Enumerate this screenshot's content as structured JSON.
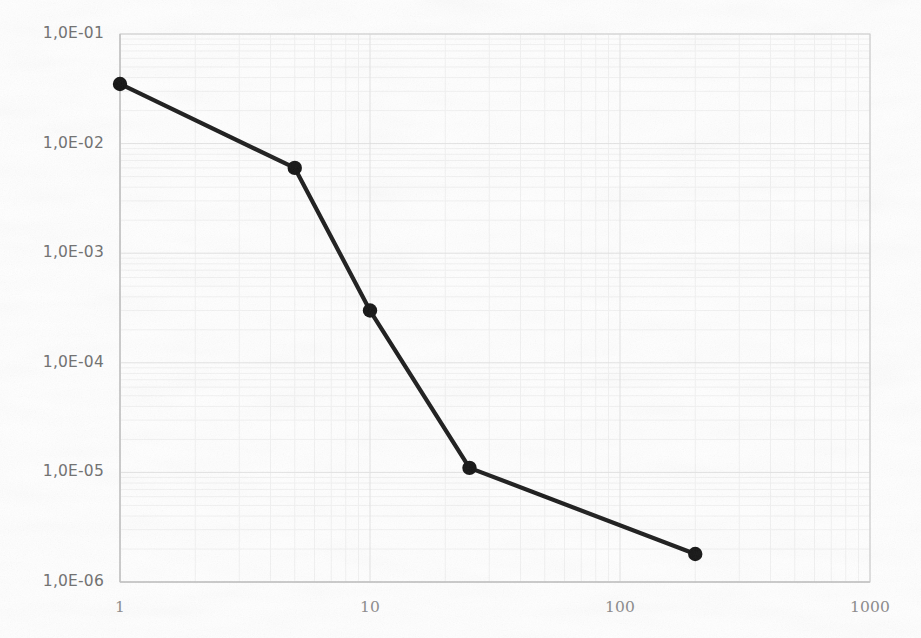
{
  "chart_data": {
    "type": "line",
    "title": "",
    "subtitle": "",
    "xlabel": "",
    "ylabel": "",
    "xscale": "log",
    "yscale": "log",
    "xlim": [
      1,
      1000
    ],
    "ylim": [
      1e-06,
      0.1
    ],
    "grid": true,
    "legend": null,
    "legend_position": "none",
    "marker": "filled-circle",
    "line_color": "#1a1a1a",
    "marker_color": "#111111",
    "x": [
      1,
      5,
      10,
      25,
      200
    ],
    "values": [
      0.035,
      0.006,
      0.0003,
      1.1e-05,
      1.8e-06
    ],
    "points": [
      {
        "x": 1,
        "y": 0.035
      },
      {
        "x": 5,
        "y": 0.006
      },
      {
        "x": 10,
        "y": 0.0003
      },
      {
        "x": 25,
        "y": 1.1e-05
      },
      {
        "x": 200,
        "y": 1.8e-06
      }
    ],
    "series": [
      {
        "name": "",
        "x": [
          1,
          5,
          10,
          25,
          200
        ],
        "values": [
          0.035,
          0.006,
          0.0003,
          1.1e-05,
          1.8e-06
        ]
      }
    ],
    "xticks": [
      1,
      10,
      100,
      1000
    ],
    "xtick_labels": [
      "1",
      "10",
      "100",
      "1000"
    ],
    "yticks": [
      0.1,
      0.01,
      0.001,
      0.0001,
      1e-05,
      1e-06
    ],
    "ytick_labels": [
      "1,0E-01",
      "1,0E-02",
      "1,0E-03",
      "1,0E-04",
      "1,0E-05",
      "1,0E-06"
    ]
  },
  "style": {
    "background": "#ffffff",
    "axis_color": "#cfcfcf",
    "grid_color": "#ececec",
    "ytick_color": "#6e6e6e",
    "xtick_color": "#8a8a8a"
  }
}
